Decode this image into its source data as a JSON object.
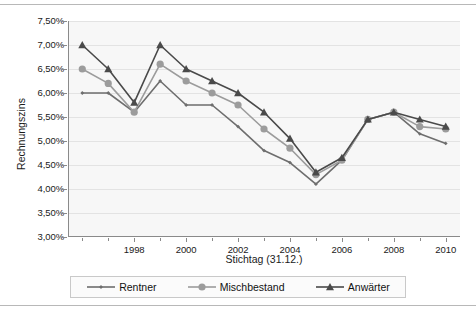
{
  "chart_data": {
    "type": "line",
    "title": "",
    "xlabel": "Stichtag (31.12.)",
    "ylabel": "Rechnungszins",
    "x": [
      1996,
      1997,
      1998,
      1999,
      2000,
      2001,
      2002,
      2003,
      2004,
      2005,
      2006,
      2007,
      2008,
      2009,
      2010
    ],
    "xtick_labels": [
      "1998",
      "2000",
      "2002",
      "2004",
      "2006",
      "2008",
      "2010"
    ],
    "xticks": [
      1998,
      2000,
      2002,
      2004,
      2006,
      2008,
      2010
    ],
    "ytick_labels": [
      "7,50%",
      "7,00%",
      "6,50%",
      "6,00%",
      "5,50%",
      "5,00%",
      "4,50%",
      "4,00%",
      "3,50%",
      "3,00%"
    ],
    "yticks": [
      7.5,
      7.0,
      6.5,
      6.0,
      5.5,
      5.0,
      4.5,
      4.0,
      3.5,
      3.0
    ],
    "ylim": [
      3.0,
      7.5
    ],
    "grid": true,
    "legend_position": "bottom",
    "series": [
      {
        "name": "Rentner",
        "marker": "small-diamond",
        "color": "#6e6e6e",
        "values": [
          6.0,
          6.0,
          5.6,
          6.25,
          5.75,
          5.75,
          5.3,
          4.8,
          4.55,
          4.1,
          4.6,
          5.45,
          5.6,
          5.15,
          4.95
        ]
      },
      {
        "name": "Mischbestand",
        "marker": "circle",
        "color": "#9c9c9c",
        "values": [
          6.5,
          6.2,
          5.6,
          6.6,
          6.25,
          6.0,
          5.75,
          5.25,
          4.85,
          4.3,
          4.6,
          5.45,
          5.6,
          5.3,
          5.25
        ]
      },
      {
        "name": "Anwärter",
        "marker": "triangle",
        "color": "#4a4a4a",
        "values": [
          7.0,
          6.5,
          5.8,
          7.0,
          6.5,
          6.25,
          6.0,
          5.6,
          5.05,
          4.35,
          4.65,
          5.45,
          5.6,
          5.45,
          5.3
        ]
      }
    ]
  },
  "axes": {
    "y_title": "Rechnungszins",
    "x_title": "Stichtag (31.12.)"
  },
  "legend": {
    "items": [
      {
        "label": "Rentner",
        "marker": "small-diamond"
      },
      {
        "label": "Mischbestand",
        "marker": "circle"
      },
      {
        "label": "Anwärter",
        "marker": "triangle"
      }
    ]
  },
  "colors": {
    "plot_background": "#f7f7f7",
    "grid": "#e3e3e3",
    "axis": "#8a8a8a",
    "series_rentner": "#6e6e6e",
    "series_mischbestand": "#9c9c9c",
    "series_anwaerter": "#4a4a4a"
  }
}
